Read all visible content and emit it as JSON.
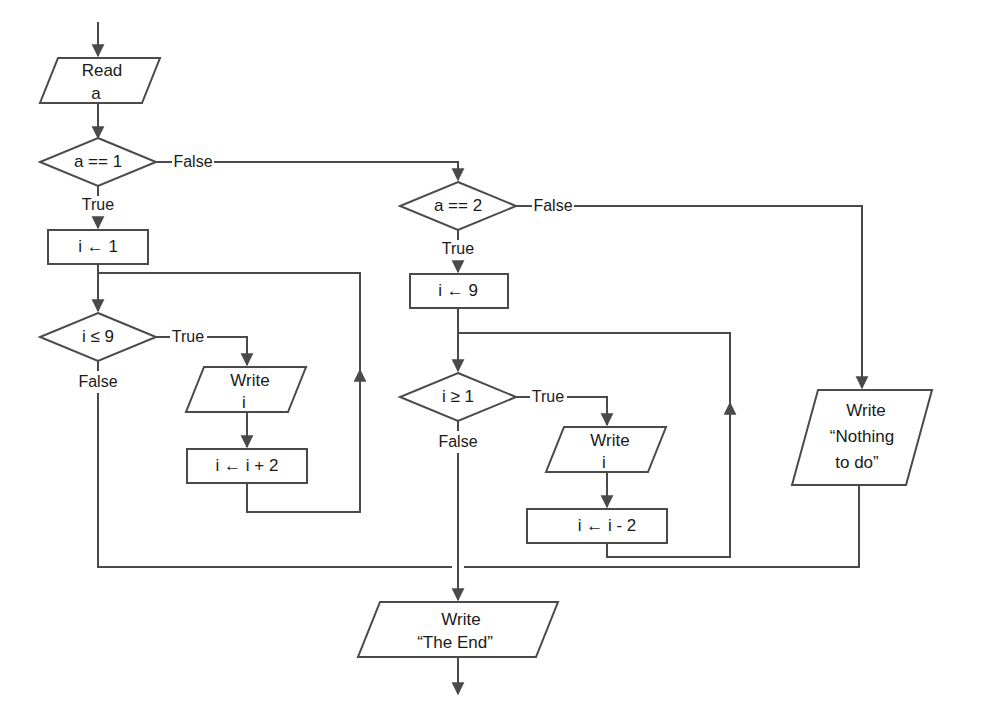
{
  "diagram": {
    "type": "flowchart",
    "style": {
      "stroke": "#4a4a4a",
      "text_color": "#1a1a1a",
      "background": "#ffffff",
      "stroke_width": 2
    },
    "nodes": [
      {
        "id": "start_arrow",
        "shape": "arrow",
        "text": ""
      },
      {
        "id": "read_a",
        "shape": "parallelogram",
        "text": "Read\na",
        "line1": "Read",
        "line2": "a"
      },
      {
        "id": "cond_a1",
        "shape": "diamond",
        "text": "a == 1"
      },
      {
        "id": "init_i1",
        "shape": "rectangle",
        "text": "i ← 1"
      },
      {
        "id": "cond_ile9",
        "shape": "diamond",
        "text": "i ≤ 9"
      },
      {
        "id": "write_i_1",
        "shape": "parallelogram",
        "text": "Write\ni",
        "line1": "Write",
        "line2": "i"
      },
      {
        "id": "inc_i",
        "shape": "rectangle",
        "text": "i ← i + 2"
      },
      {
        "id": "cond_a2",
        "shape": "diamond",
        "text": "a == 2"
      },
      {
        "id": "init_i9",
        "shape": "rectangle",
        "text": "i ← 9"
      },
      {
        "id": "cond_ige1",
        "shape": "diamond",
        "text": "i ≥ 1"
      },
      {
        "id": "write_i_2",
        "shape": "parallelogram",
        "text": "Write\ni",
        "line1": "Write",
        "line2": "i"
      },
      {
        "id": "dec_i",
        "shape": "rectangle",
        "text": "i ← i - 2"
      },
      {
        "id": "write_nothing",
        "shape": "parallelogram",
        "text": "Write\n“Nothing\nto do”",
        "line1": "Write",
        "line2": "“Nothing",
        "line3": "to do”"
      },
      {
        "id": "write_end",
        "shape": "parallelogram",
        "text": "Write\n“The End”",
        "line1": "Write",
        "line2": "“The End”"
      }
    ],
    "edge_labels": [
      {
        "id": "a1_false",
        "text": "False",
        "from": "cond_a1",
        "to": "cond_a2"
      },
      {
        "id": "a1_true",
        "text": "True",
        "from": "cond_a1",
        "to": "init_i1"
      },
      {
        "id": "ile9_true",
        "text": "True",
        "from": "cond_ile9",
        "to": "write_i_1"
      },
      {
        "id": "ile9_false",
        "text": "False",
        "from": "cond_ile9",
        "to": "write_end"
      },
      {
        "id": "a2_false",
        "text": "False",
        "from": "cond_a2",
        "to": "write_nothing"
      },
      {
        "id": "a2_true",
        "text": "True",
        "from": "cond_a2",
        "to": "init_i9"
      },
      {
        "id": "ige1_true",
        "text": "True",
        "from": "cond_ige1",
        "to": "write_i_2"
      },
      {
        "id": "ige1_false",
        "text": "False",
        "from": "cond_ige1",
        "to": "write_end"
      }
    ]
  }
}
